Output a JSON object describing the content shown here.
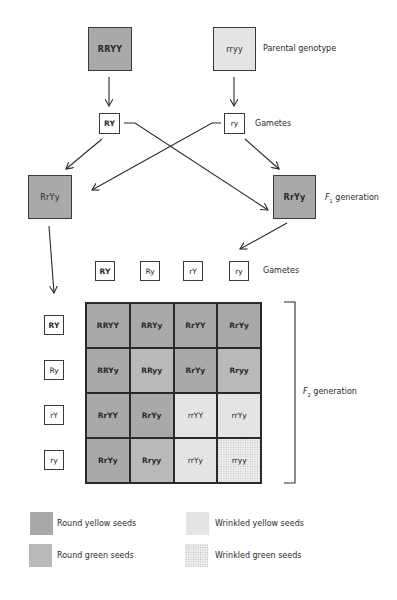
{
  "parents": {
    "left": {
      "genotype": "RRYY",
      "phenotype": "round-yellow"
    },
    "right": {
      "genotype": "rryy",
      "phenotype": "wrinkled-green"
    },
    "label": "Parental genotype"
  },
  "parent_gametes": {
    "left": "RY",
    "right": "ry",
    "label": "Gametes"
  },
  "f1": {
    "left": "RrYy",
    "right": "RrYy",
    "label_prefix": "F",
    "label_sub": "1",
    "label_suffix": " generation"
  },
  "f1_gametes": {
    "columns": [
      "RY",
      "Ry",
      "rY",
      "ry"
    ],
    "rows": [
      "RY",
      "Ry",
      "rY",
      "ry"
    ],
    "label": "Gametes"
  },
  "punnett": {
    "cells": [
      [
        {
          "g": "RRYY",
          "p": "round-yellow"
        },
        {
          "g": "RRYy",
          "p": "round-yellow"
        },
        {
          "g": "RrYY",
          "p": "round-yellow"
        },
        {
          "g": "RrYy",
          "p": "round-yellow"
        }
      ],
      [
        {
          "g": "RRYy",
          "p": "round-yellow"
        },
        {
          "g": "RRyy",
          "p": "round-green"
        },
        {
          "g": "RrYy",
          "p": "round-yellow"
        },
        {
          "g": "Rryy",
          "p": "round-green"
        }
      ],
      [
        {
          "g": "RrYY",
          "p": "round-yellow"
        },
        {
          "g": "RrYy",
          "p": "round-yellow"
        },
        {
          "g": "rrYY",
          "p": "wrinkled-yellow"
        },
        {
          "g": "rrYy",
          "p": "wrinkled-yellow"
        }
      ],
      [
        {
          "g": "RrYy",
          "p": "round-yellow"
        },
        {
          "g": "Rryy",
          "p": "round-green"
        },
        {
          "g": "rrYy",
          "p": "wrinkled-yellow"
        },
        {
          "g": "rryy",
          "p": "wrinkled-green"
        }
      ]
    ]
  },
  "f2": {
    "label_prefix": "F",
    "label_sub": "2",
    "label_suffix": " generation"
  },
  "legend": {
    "items": [
      {
        "key": "round-yellow",
        "label": "Round yellow seeds"
      },
      {
        "key": "round-green",
        "label": "Round green seeds"
      },
      {
        "key": "wrinkled-yellow",
        "label": "Wrinkled yellow seeds"
      },
      {
        "key": "wrinkled-green",
        "label": "Wrinkled green seeds"
      }
    ]
  },
  "colors": {
    "round-yellow": "#a9a9a9",
    "round-green": "#b9b9b9",
    "wrinkled-yellow": "#e4e4e4",
    "wrinkled-green": "#ececec",
    "stroke": "#2a2a2a"
  }
}
